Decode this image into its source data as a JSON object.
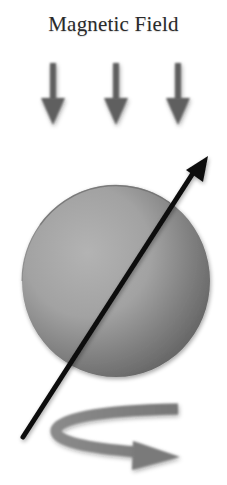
{
  "title": "Magnetic Field",
  "figure": {
    "field_arrows": {
      "count": 3,
      "direction": "down",
      "color": "#5e5e5e"
    },
    "sphere": {
      "light_color": "#ababab",
      "dark_color": "#6a6a6a",
      "outline_color": "#6f6f6f"
    },
    "spin_axis": {
      "color": "#111111",
      "direction": "up-right"
    },
    "rotation_arrow": {
      "color": "#7a7a7a",
      "direction": "counter-clockwise (viewed from above)"
    }
  }
}
